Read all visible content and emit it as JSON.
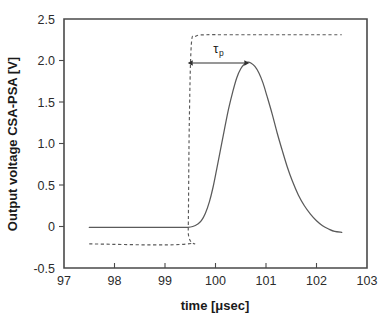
{
  "chart_data": {
    "type": "line",
    "title": "",
    "xlabel": "time [μsec]",
    "ylabel": "Output voltage CSA-PSA [V]",
    "xlim": [
      97,
      103
    ],
    "ylim": [
      -0.5,
      2.5
    ],
    "grid": false,
    "legend_position": "none",
    "xticks": [
      97,
      98,
      99,
      100,
      101,
      102,
      103
    ],
    "xtick_labels": [
      "97",
      "98",
      "99",
      "100",
      "101",
      "102",
      "103"
    ],
    "yticks": [
      -0.5,
      0,
      0.5,
      1.0,
      1.5,
      2.0,
      2.5
    ],
    "ytick_labels": [
      "-0.5",
      "0",
      "0.5",
      "1.0",
      "1.5",
      "2.0",
      "2.5"
    ],
    "series": [
      {
        "name": "CSA-PSA output pulse",
        "style": "solid",
        "color": "#5a5a5a",
        "x": [
          97.5,
          97.7,
          97.9,
          98.1,
          98.3,
          98.5,
          98.7,
          98.9,
          99.1,
          99.3,
          99.45,
          99.55,
          99.65,
          99.72,
          99.8,
          99.88,
          99.95,
          100.02,
          100.1,
          100.18,
          100.26,
          100.34,
          100.42,
          100.5,
          100.58,
          100.64,
          100.7,
          100.78,
          100.86,
          100.94,
          101.02,
          101.12,
          101.22,
          101.32,
          101.42,
          101.52,
          101.64,
          101.76,
          101.88,
          102.0,
          102.12,
          102.24,
          102.36,
          102.5
        ],
        "y": [
          -0.01,
          -0.01,
          -0.01,
          -0.01,
          -0.01,
          -0.01,
          -0.01,
          -0.01,
          -0.01,
          -0.01,
          -0.01,
          0.0,
          0.03,
          0.07,
          0.16,
          0.3,
          0.47,
          0.68,
          0.93,
          1.18,
          1.42,
          1.62,
          1.79,
          1.9,
          1.96,
          1.98,
          1.97,
          1.93,
          1.85,
          1.73,
          1.57,
          1.36,
          1.13,
          0.92,
          0.72,
          0.55,
          0.38,
          0.25,
          0.15,
          0.07,
          0.01,
          -0.03,
          -0.06,
          -0.07
        ]
      },
      {
        "name": "Input step (shaper reference)",
        "style": "dashed",
        "color": "#5a5a5a",
        "x": [
          97.5,
          99.44,
          99.46,
          99.48,
          99.52,
          99.6,
          99.8,
          100.2,
          100.8,
          101.4,
          102.0,
          102.5
        ],
        "y": [
          -0.21,
          -0.21,
          -0.05,
          1.2,
          2.18,
          2.29,
          2.31,
          2.31,
          2.31,
          2.31,
          2.31,
          2.31
        ]
      }
    ],
    "annotations": [
      {
        "name": "peaking-time",
        "label": "τ",
        "label_sub": "p",
        "type": "double-arrow",
        "x_start": 99.45,
        "x_end": 100.67,
        "y": 1.97
      }
    ]
  }
}
